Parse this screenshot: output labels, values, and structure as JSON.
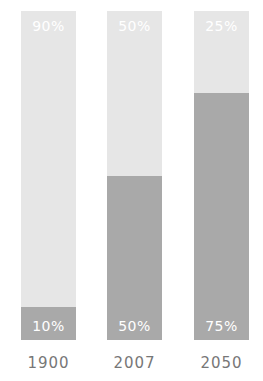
{
  "chart_data": {
    "type": "bar",
    "stacked": true,
    "normalized": true,
    "title": "",
    "xlabel": "",
    "ylabel": "",
    "ylim": [
      0,
      100
    ],
    "grid": false,
    "legend": null,
    "categories": [
      "1900",
      "2007",
      "2050"
    ],
    "series": [
      {
        "name": "bottom (dark)",
        "color": "#a9a9a9",
        "values": [
          10,
          50,
          75
        ]
      },
      {
        "name": "top (light)",
        "color": "#e6e6e6",
        "values": [
          90,
          50,
          25
        ]
      }
    ]
  },
  "bars": [
    {
      "year": "1900",
      "top_label": "90%",
      "bottom_label": "10%",
      "bottom_pct": 10
    },
    {
      "year": "2007",
      "top_label": "50%",
      "bottom_label": "50%",
      "bottom_pct": 50
    },
    {
      "year": "2050",
      "top_label": "25%",
      "bottom_label": "75%",
      "bottom_pct": 75
    }
  ],
  "colors": {
    "dark": "#a9a9a9",
    "light": "#e6e6e6",
    "year_text": "#777777"
  }
}
